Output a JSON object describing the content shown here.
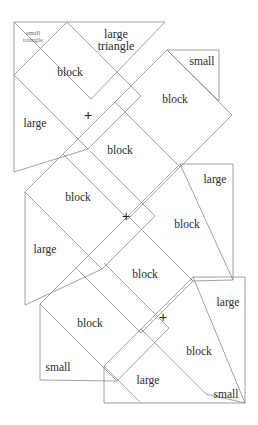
{
  "figure": {
    "canvas": {
      "width": 258,
      "height": 425
    },
    "style": {
      "background": "#ffffff",
      "line_color": "#8a8a8a",
      "line_width": 0.8,
      "text_color": "#2b2b2b",
      "faint_text_color": "#6e6e6e"
    },
    "labels": [
      {
        "id": "small-triangle-1",
        "text": "small\ntriangle",
        "x": 33,
        "y": 36,
        "kind": "smalltri"
      },
      {
        "id": "large-triangle-1",
        "text": "large\ntriangle",
        "x": 116,
        "y": 40,
        "kind": "largetri"
      },
      {
        "id": "block-1",
        "text": "block",
        "x": 70,
        "y": 73,
        "kind": "block"
      },
      {
        "id": "small-1",
        "text": "small",
        "x": 202,
        "y": 62,
        "kind": "small"
      },
      {
        "id": "block-2",
        "text": "block",
        "x": 175,
        "y": 100,
        "kind": "block"
      },
      {
        "id": "large-1",
        "text": "large",
        "x": 35,
        "y": 124,
        "kind": "large"
      },
      {
        "id": "plus-1",
        "text": "+",
        "x": 88,
        "y": 115,
        "kind": "plus"
      },
      {
        "id": "block-3",
        "text": "block",
        "x": 120,
        "y": 151,
        "kind": "block"
      },
      {
        "id": "block-4",
        "text": "block",
        "x": 78,
        "y": 198,
        "kind": "block"
      },
      {
        "id": "large-2",
        "text": "large",
        "x": 215,
        "y": 180,
        "kind": "large"
      },
      {
        "id": "large-3",
        "text": "large",
        "x": 45,
        "y": 250,
        "kind": "large"
      },
      {
        "id": "plus-2",
        "text": "+",
        "x": 126,
        "y": 216,
        "kind": "plus"
      },
      {
        "id": "block-5",
        "text": "block",
        "x": 187,
        "y": 225,
        "kind": "block"
      },
      {
        "id": "block-6",
        "text": "block",
        "x": 145,
        "y": 275,
        "kind": "block"
      },
      {
        "id": "block-7",
        "text": "block",
        "x": 90,
        "y": 324,
        "kind": "block"
      },
      {
        "id": "large-4",
        "text": "large",
        "x": 228,
        "y": 303,
        "kind": "large"
      },
      {
        "id": "plus-3",
        "text": "+",
        "x": 163,
        "y": 317,
        "kind": "plus"
      },
      {
        "id": "small-2",
        "text": "small",
        "x": 58,
        "y": 368,
        "kind": "small"
      },
      {
        "id": "block-8",
        "text": "block",
        "x": 199,
        "y": 352,
        "kind": "block"
      },
      {
        "id": "large-5",
        "text": "large",
        "x": 148,
        "y": 381,
        "kind": "large"
      },
      {
        "id": "small-3",
        "text": "small",
        "x": 226,
        "y": 395,
        "kind": "small"
      }
    ],
    "segments": [
      [
        14,
        22,
        165,
        22
      ],
      [
        14,
        22,
        14,
        172
      ],
      [
        14,
        22,
        91,
        99
      ],
      [
        91,
        99,
        165,
        22
      ],
      [
        14,
        75,
        67,
        22
      ],
      [
        14,
        75,
        88,
        149
      ],
      [
        67,
        22,
        141,
        96
      ],
      [
        88,
        149,
        141,
        96
      ],
      [
        88,
        149,
        14,
        172
      ],
      [
        219,
        50,
        219,
        101
      ],
      [
        219,
        50,
        167,
        50
      ],
      [
        167,
        50,
        219,
        101
      ],
      [
        167,
        50,
        115,
        102
      ],
      [
        167,
        50,
        232,
        115
      ],
      [
        115,
        102,
        180,
        167
      ],
      [
        180,
        167,
        232,
        115
      ],
      [
        115,
        102,
        63,
        154
      ],
      [
        63,
        154,
        128,
        219
      ],
      [
        128,
        219,
        180,
        167
      ],
      [
        63,
        154,
        25,
        192
      ],
      [
        25,
        192,
        25,
        305
      ],
      [
        25,
        192,
        102,
        269
      ],
      [
        102,
        269,
        155,
        216
      ],
      [
        155,
        216,
        90,
        151
      ],
      [
        102,
        269,
        25,
        305
      ],
      [
        233,
        164,
        233,
        280
      ],
      [
        233,
        164,
        180,
        164
      ],
      [
        180,
        164,
        233,
        280
      ],
      [
        180,
        164,
        128,
        216
      ],
      [
        128,
        216,
        193,
        281
      ],
      [
        193,
        281,
        233,
        280
      ],
      [
        128,
        216,
        76,
        268
      ],
      [
        76,
        268,
        141,
        333
      ],
      [
        141,
        333,
        193,
        281
      ],
      [
        76,
        268,
        40,
        304
      ],
      [
        40,
        304,
        40,
        380
      ],
      [
        40,
        304,
        117,
        381
      ],
      [
        117,
        381,
        169,
        328
      ],
      [
        169,
        328,
        104,
        263
      ],
      [
        117,
        381,
        40,
        380
      ],
      [
        245,
        277,
        245,
        403
      ],
      [
        245,
        277,
        193,
        277
      ],
      [
        193,
        277,
        245,
        403
      ],
      [
        193,
        277,
        141,
        329
      ],
      [
        141,
        329,
        206,
        394
      ],
      [
        206,
        394,
        245,
        403
      ],
      [
        141,
        329,
        104,
        366
      ],
      [
        104,
        366,
        104,
        403
      ],
      [
        104,
        366,
        141,
        403
      ],
      [
        104,
        403,
        245,
        403
      ]
    ]
  }
}
